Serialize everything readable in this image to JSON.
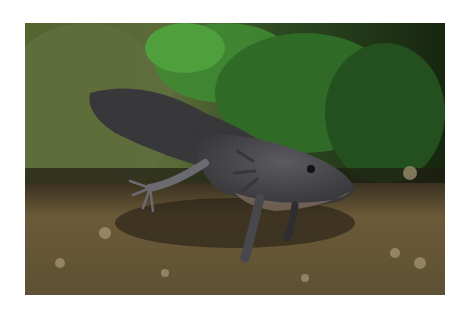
{
  "image": {
    "subject": "axolotl",
    "description": "Dark gray axolotl walking on gravel substrate in front of green aquatic plants",
    "colors": {
      "background_page": "#ffffff",
      "moss_left": "#5f6d3c",
      "plant_green": "#3f8a32",
      "plant_dark": "#1f3a18",
      "gravel": "#6b5a38",
      "axolotl_body": "#4a4a4e",
      "axolotl_belly": "#7a6a5e"
    }
  }
}
